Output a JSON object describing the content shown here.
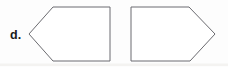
{
  "figure": {
    "label": "d.",
    "background_color": "#fdfdfd",
    "stroke_color": "#6b6b70",
    "fill_color": "#ffffff",
    "label_color": "#1a1a1a",
    "shapes": [
      {
        "name": "left-pointing-pentagon",
        "sides": 5,
        "points": "29,34 53,7 110,7 110,61 53,61",
        "direction": "left"
      },
      {
        "name": "right-pointing-pentagon",
        "sides": 5,
        "points": "131,7 189,7 215,34 190,61 131,61",
        "direction": "right"
      }
    ],
    "label_position": {
      "x": 10,
      "y": 39
    }
  }
}
